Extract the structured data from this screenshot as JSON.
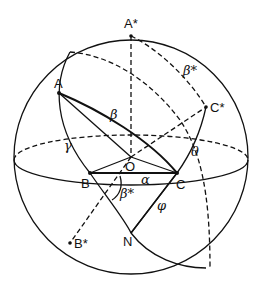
{
  "figure": {
    "type": "spherical-triangle-diagram",
    "points": {
      "A": {
        "label": "A",
        "x": 59,
        "y": 93
      },
      "A_star": {
        "label": "A*",
        "x": 131,
        "y": 36
      },
      "B": {
        "label": "B",
        "x": 90,
        "y": 173
      },
      "B_star": {
        "label": "B*",
        "x": 70,
        "y": 243
      },
      "C": {
        "label": "C",
        "x": 177,
        "y": 173
      },
      "C_star": {
        "label": "C*",
        "x": 206,
        "y": 107
      },
      "O": {
        "label": "O",
        "x": 131,
        "y": 157
      },
      "N": {
        "label": "N",
        "x": 131,
        "y": 233
      }
    },
    "angles": {
      "alpha": "α",
      "beta": "β",
      "gamma": "γ",
      "theta": "θ",
      "phi": "φ",
      "beta_star": "β*"
    },
    "colors": {
      "stroke": "#111111",
      "background": "#ffffff"
    }
  }
}
